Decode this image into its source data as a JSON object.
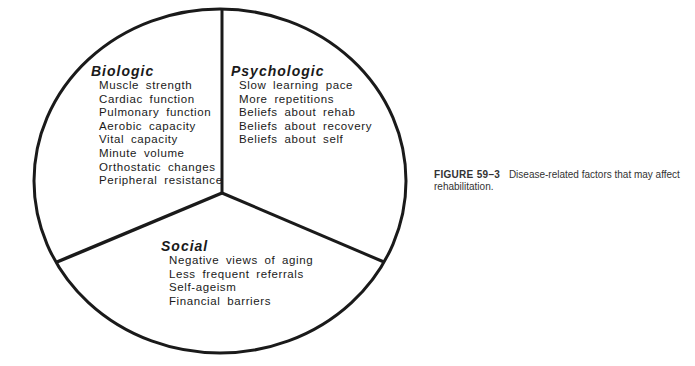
{
  "diagram": {
    "type": "three-sector circle",
    "sectors": [
      {
        "title": "Biologic",
        "items": [
          "Muscle strength",
          "Cardiac function",
          "Pulmonary function",
          "Aerobic capacity",
          "Vital capacity",
          "Minute volume",
          "Orthostatic changes",
          "Peripheral resistance"
        ]
      },
      {
        "title": "Psychologic",
        "items": [
          "Slow learning pace",
          "More repetitions",
          "Beliefs about rehab",
          "Beliefs about recovery",
          "Beliefs about self"
        ]
      },
      {
        "title": "Social",
        "items": [
          "Negative views of aging",
          "Less frequent referrals",
          "Self-ageism",
          "Financial barriers"
        ]
      }
    ],
    "colors": {
      "stroke": "#1a1a1a",
      "background": "#ffffff"
    }
  },
  "caption": {
    "label": "FIGURE 59–3",
    "text": "Disease-related factors that may affect rehabilitation."
  }
}
